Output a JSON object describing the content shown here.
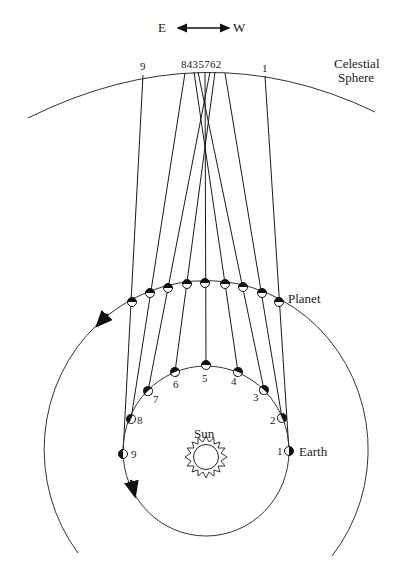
{
  "direction": {
    "east": "E",
    "west": "W"
  },
  "labels": {
    "celestial_line1": "Celestial",
    "celestial_line2": "Sphere",
    "planet": "Planet",
    "earth": "Earth",
    "sun": "Sun"
  },
  "sphere_labels": {
    "sphere_9": "9",
    "sphere_cluster": "8435762",
    "sphere_1": "1"
  },
  "earth_numbers": [
    "1",
    "2",
    "3",
    "4",
    "5",
    "6",
    "7",
    "8",
    "9"
  ],
  "positions": [
    {
      "n": "1",
      "earth": [
        289,
        451
      ],
      "planet": [
        279,
        302
      ],
      "sphere": [
        265,
        76
      ]
    },
    {
      "n": "2",
      "earth": [
        282,
        418
      ],
      "planet": [
        262,
        293
      ],
      "sphere": [
        225,
        73
      ]
    },
    {
      "n": "3",
      "earth": [
        264,
        390
      ],
      "planet": [
        243,
        287
      ],
      "sphere": [
        198,
        72
      ]
    },
    {
      "n": "4",
      "earth": [
        238,
        372
      ],
      "planet": [
        225,
        284
      ],
      "sphere": [
        194,
        72
      ]
    },
    {
      "n": "5",
      "earth": [
        206,
        365
      ],
      "planet": [
        205,
        283
      ],
      "sphere": [
        205,
        72
      ]
    },
    {
      "n": "6",
      "earth": [
        175,
        372
      ],
      "planet": [
        187,
        284
      ],
      "sphere": [
        215,
        72
      ]
    },
    {
      "n": "7",
      "earth": [
        148,
        391
      ],
      "planet": [
        168,
        288
      ],
      "sphere": [
        210,
        72
      ]
    },
    {
      "n": "8",
      "earth": [
        131,
        419
      ],
      "planet": [
        150,
        293
      ],
      "sphere": [
        185,
        73
      ]
    },
    {
      "n": "9",
      "earth": [
        123,
        454
      ],
      "planet": [
        132,
        302
      ],
      "sphere": [
        143,
        75
      ]
    }
  ]
}
